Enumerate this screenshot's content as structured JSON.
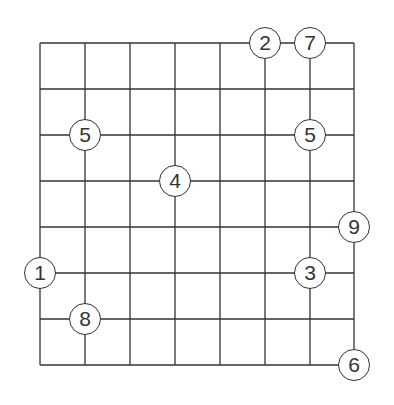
{
  "puzzle": {
    "type": "intersection-number-grid",
    "columns": 7,
    "rows": 7,
    "grid_x": [
      40,
      85,
      130,
      175,
      220,
      265,
      310,
      354
    ],
    "grid_y": [
      43,
      89,
      135,
      181,
      227,
      273,
      319,
      365
    ],
    "line_color": "#333333",
    "background": "#ffffff",
    "clues": [
      {
        "value": "2",
        "col": 5,
        "row": 0
      },
      {
        "value": "7",
        "col": 6,
        "row": 0
      },
      {
        "value": "5",
        "col": 1,
        "row": 2
      },
      {
        "value": "5",
        "col": 6,
        "row": 2
      },
      {
        "value": "4",
        "col": 3,
        "row": 3
      },
      {
        "value": "9",
        "col": 7,
        "row": 4
      },
      {
        "value": "1",
        "col": 0,
        "row": 5
      },
      {
        "value": "3",
        "col": 6,
        "row": 5
      },
      {
        "value": "8",
        "col": 1,
        "row": 6
      },
      {
        "value": "6",
        "col": 7,
        "row": 7
      }
    ]
  }
}
